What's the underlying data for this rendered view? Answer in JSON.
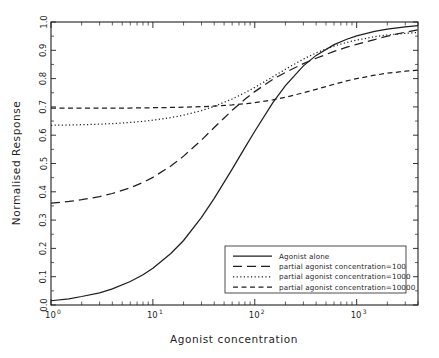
{
  "chart_data": {
    "type": "line",
    "title": "",
    "xlabel": "Agonist concentration",
    "ylabel": "Normalised Response",
    "xscale": "log",
    "xlim": [
      1,
      4000
    ],
    "ylim": [
      0.0,
      1.0
    ],
    "grid": false,
    "legend_position": "lower right",
    "xticklabels": [
      "10^0",
      "10^1",
      "10^2",
      "10^3"
    ],
    "xtickvalues": [
      1,
      10,
      100,
      1000
    ],
    "yticklabels": [
      "0.0",
      "0.1",
      "0.2",
      "0.3",
      "0.4",
      "0.5",
      "0.6",
      "0.7",
      "0.8",
      "0.9",
      "1.0"
    ],
    "ytickvalues": [
      0.0,
      0.1,
      0.2,
      0.3,
      0.4,
      0.5,
      0.6,
      0.7,
      0.8,
      0.9,
      1.0
    ],
    "crossover_point": {
      "x": 100,
      "y": 0.7
    },
    "series": [
      {
        "name": "Agonist alone",
        "style": "solid",
        "x": [
          1,
          1.5,
          2,
          3,
          4,
          6,
          8,
          10,
          15,
          20,
          30,
          40,
          60,
          80,
          100,
          150,
          200,
          300,
          400,
          600,
          800,
          1000,
          1500,
          2000,
          3000,
          4000
        ],
        "values": [
          0.015,
          0.022,
          0.03,
          0.043,
          0.057,
          0.083,
          0.107,
          0.13,
          0.182,
          0.228,
          0.31,
          0.377,
          0.48,
          0.556,
          0.614,
          0.714,
          0.775,
          0.845,
          0.882,
          0.92,
          0.939,
          0.951,
          0.967,
          0.975,
          0.983,
          0.987
        ]
      },
      {
        "name": "partial agonist concentration=100",
        "style": "long-dash",
        "x": [
          1,
          1.5,
          2,
          3,
          4,
          6,
          8,
          10,
          15,
          20,
          30,
          40,
          60,
          80,
          100,
          150,
          200,
          300,
          400,
          600,
          800,
          1000,
          1500,
          2000,
          3000,
          4000
        ],
        "values": [
          0.36,
          0.366,
          0.372,
          0.383,
          0.394,
          0.414,
          0.433,
          0.451,
          0.491,
          0.526,
          0.583,
          0.627,
          0.688,
          0.727,
          0.754,
          0.797,
          0.822,
          0.853,
          0.872,
          0.896,
          0.911,
          0.921,
          0.938,
          0.95,
          0.964,
          0.972
        ]
      },
      {
        "name": "partial agonist concentration=1000",
        "style": "dotted",
        "x": [
          1,
          1.5,
          2,
          3,
          4,
          6,
          8,
          10,
          15,
          20,
          30,
          40,
          60,
          80,
          100,
          150,
          200,
          300,
          400,
          600,
          800,
          1000,
          1500,
          2000,
          3000,
          4000
        ],
        "values": [
          0.635,
          0.636,
          0.637,
          0.639,
          0.641,
          0.645,
          0.649,
          0.653,
          0.662,
          0.671,
          0.687,
          0.702,
          0.728,
          0.75,
          0.769,
          0.806,
          0.833,
          0.869,
          0.891,
          0.915,
          0.928,
          0.936,
          0.948,
          0.954,
          0.96,
          0.963
        ]
      },
      {
        "name": "partial agonist concentration=10000",
        "style": "short-dash",
        "x": [
          1,
          1.5,
          2,
          3,
          4,
          6,
          8,
          10,
          15,
          20,
          30,
          40,
          60,
          80,
          100,
          150,
          200,
          300,
          400,
          600,
          800,
          1000,
          1500,
          2000,
          3000,
          4000
        ],
        "values": [
          0.696,
          0.696,
          0.696,
          0.696,
          0.696,
          0.696,
          0.697,
          0.697,
          0.698,
          0.699,
          0.701,
          0.703,
          0.707,
          0.711,
          0.715,
          0.725,
          0.734,
          0.75,
          0.762,
          0.78,
          0.792,
          0.8,
          0.812,
          0.819,
          0.826,
          0.83
        ]
      }
    ]
  },
  "legend": {
    "entries": [
      {
        "label": "Agonist alone"
      },
      {
        "label": "partial agonist concentration=100"
      },
      {
        "label": "partial agonist concentration=1000"
      },
      {
        "label": "partial agonist concentration=10000"
      }
    ]
  },
  "axes": {
    "x_title": "Agonist concentration",
    "y_title": "Normalised Response"
  }
}
